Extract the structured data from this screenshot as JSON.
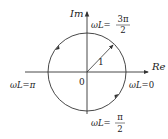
{
  "diagram": {
    "axes": {
      "x_label": "Re",
      "y_label": "Im",
      "origin_label": "0"
    },
    "circle": {
      "radius_label": "1"
    },
    "points": [
      {
        "id": "zero",
        "prefix": "ωL=",
        "value": "0"
      },
      {
        "id": "half_pi",
        "prefix": "ωL=",
        "numerator": "π",
        "denominator": "2"
      },
      {
        "id": "pi",
        "prefix": "ωL=",
        "value": "π"
      },
      {
        "id": "three_half_pi",
        "prefix": "ωL=",
        "numerator": "3π",
        "denominator": "2"
      }
    ],
    "colors": {
      "stroke": "#333333",
      "text": "#222222"
    }
  }
}
